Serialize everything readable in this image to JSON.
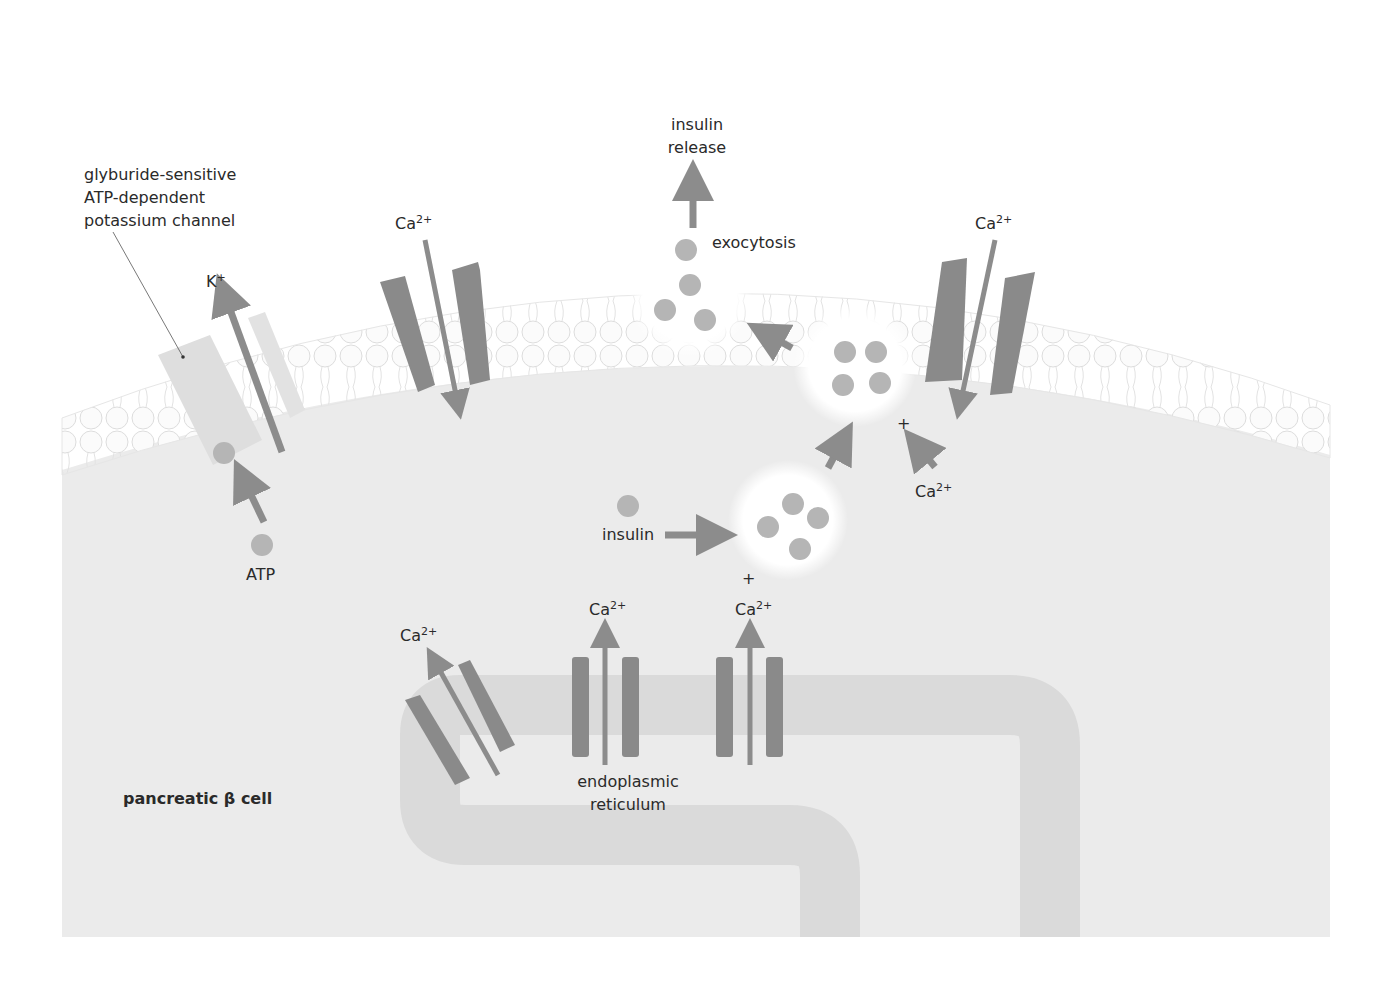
{
  "title": "pancreatic β cell",
  "labels": {
    "channel_name": [
      "glyburide-sensitive",
      "ATP-dependent",
      "potassium channel"
    ],
    "potassium": {
      "base": "K",
      "sup": "+"
    },
    "atp": "ATP",
    "calcium": {
      "base": "Ca",
      "sup": "2+"
    },
    "insulin_release": [
      "insulin",
      "release"
    ],
    "exocytosis": "exocytosis",
    "insulin": "insulin",
    "plus": "+",
    "er": [
      "endoplasmic",
      "reticulum"
    ],
    "cell": "pancreatic β cell"
  },
  "colors": {
    "background": "#ffffff",
    "cytoplasm": "#ebebeb",
    "membrane": "#f6f6f6",
    "lipid_outline": "#d8d8d8",
    "channel_dark": "#8a8a8a",
    "channel_light": "#dcdcdc",
    "arrow": "#8c8c8c",
    "insulin_granule": "#b5b5b5",
    "er": "#dadada",
    "vesicle": "#ffffff",
    "text": "#2a2a2a"
  }
}
